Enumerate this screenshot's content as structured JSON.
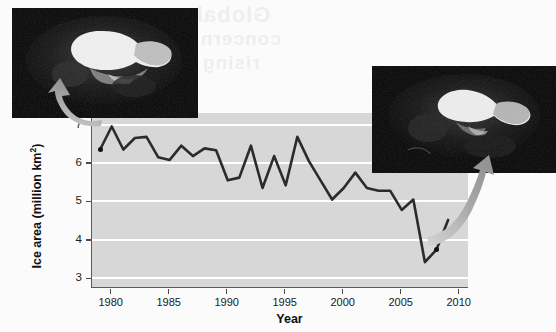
{
  "figure": {
    "background_color": "#fbfbfb",
    "bleed_through_text": {
      "line1": "Global",
      "line2": "concern",
      "line3": "rising"
    }
  },
  "chart_data": {
    "type": "line",
    "title": "",
    "xlabel": "Year",
    "ylabel": "Ice area (million km2)",
    "ylabel_html": "Ice area (million km<sup>2</sup>)",
    "xlim": [
      1978.3,
      2010.8
    ],
    "ylim": [
      2.75,
      7.3
    ],
    "xticks": [
      1980,
      1985,
      1990,
      1995,
      2000,
      2005,
      2010
    ],
    "yticks": [
      3,
      4,
      5,
      6,
      7
    ],
    "grid": "horizontal-white",
    "plot_background_color": "#d7d7d7",
    "gridline_color": "#ffffff",
    "line_color": "#2b2b2b",
    "legend": "none",
    "x": [
      1979,
      1980,
      1981,
      1982,
      1983,
      1984,
      1985,
      1986,
      1987,
      1988,
      1989,
      1990,
      1991,
      1992,
      1993,
      1994,
      1995,
      1996,
      1997,
      1998,
      1999,
      2000,
      2001,
      2002,
      2003,
      2004,
      2005,
      2006,
      2007,
      2008,
      2009
    ],
    "values": [
      6.35,
      6.95,
      6.35,
      6.65,
      6.68,
      6.15,
      6.08,
      6.45,
      6.18,
      6.38,
      6.33,
      5.55,
      5.62,
      6.45,
      5.35,
      6.18,
      5.42,
      6.68,
      6.05,
      5.55,
      5.05,
      5.35,
      5.75,
      5.35,
      5.28,
      5.28,
      4.78,
      5.05,
      3.42,
      3.75,
      4.52
    ],
    "marked_points": [
      {
        "x": 1979,
        "y": 6.35,
        "label": "start-of-record-marker"
      },
      {
        "x": 2008,
        "y": 3.75,
        "label": "recent-record-marker"
      }
    ],
    "annotations": [
      {
        "name": "arrow-to-left-satellite-image",
        "from": [
          1979,
          6.35
        ],
        "to": "satellite-image-1979"
      },
      {
        "name": "arrow-to-right-satellite-image",
        "from": [
          2008,
          3.75
        ],
        "to": "satellite-image-2008"
      }
    ]
  },
  "images": {
    "left": {
      "name": "satellite-image-arctic-sea-ice-large-extent",
      "description": "Satellite image of Arctic sea ice with large white ice cap on black background"
    },
    "right": {
      "name": "satellite-image-arctic-sea-ice-reduced-extent",
      "description": "Satellite image of Arctic sea ice with visibly reduced white ice cap on black background"
    }
  }
}
